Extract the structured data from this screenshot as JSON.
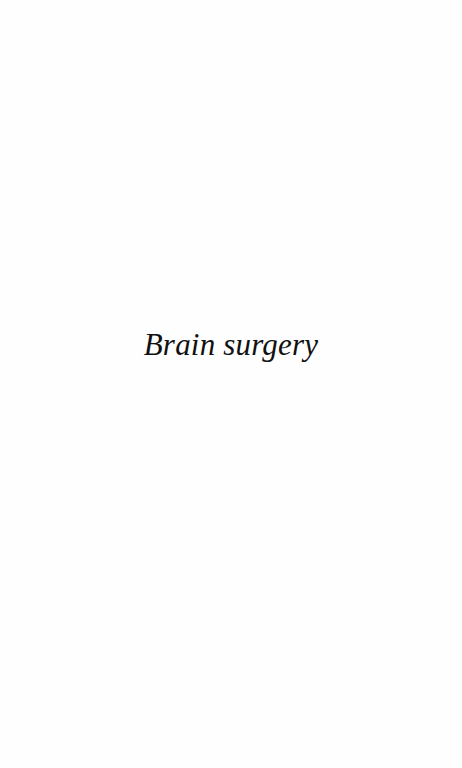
{
  "page": {
    "type": "half-title",
    "title": "Brain surgery"
  },
  "colors": {
    "background": "#fefefe",
    "text": "#111111"
  }
}
